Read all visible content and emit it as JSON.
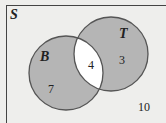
{
  "diagram": {
    "type": "venn",
    "universe_label": "S",
    "sets": [
      {
        "name": "B",
        "only_count": "7"
      },
      {
        "name": "T",
        "only_count": "3"
      }
    ],
    "intersection_count": "4",
    "outside_count": "10",
    "colors": {
      "background": "#eeeeec",
      "set_fill": "#b5b5b5",
      "intersection_fill": "#ffffff",
      "stroke": "#555555"
    }
  }
}
